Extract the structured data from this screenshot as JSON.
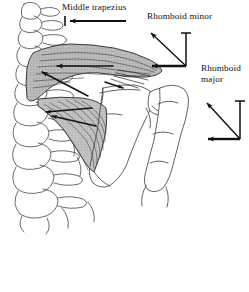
{
  "figure": {
    "type": "anatomical-diagram",
    "background_color": "#ffffff",
    "ink_color": "#111111",
    "muscle_fill_color": "#b4b4b4"
  },
  "labels": {
    "middle_trapezius": "Middle trapezius",
    "rhomboid_minor": "Rhomboid minor",
    "rhomboid_major_line1": "Rhomboid",
    "rhomboid_major_line2": "major"
  },
  "structures": {
    "vertebral_column": "vertebral-column",
    "scapula": "scapula",
    "humerus": "humerus",
    "middle_trapezius_muscle": "middle-trapezius-muscle",
    "rhomboid_major_muscle": "rhomboid-major-muscle"
  },
  "vectors": {
    "middle_trapezius": {
      "name": "middle-trapezius-force-arrow",
      "direction": "horizontal-left",
      "components": [
        "horizontal"
      ]
    },
    "rhomboid_minor": {
      "name": "rhomboid-minor-force-vector",
      "direction": "up-and-left",
      "components": [
        "horizontal-left",
        "vertical-up"
      ]
    },
    "rhomboid_major": {
      "name": "rhomboid-major-force-vector",
      "direction": "up-and-left",
      "components": [
        "horizontal-left",
        "vertical-up"
      ]
    }
  }
}
